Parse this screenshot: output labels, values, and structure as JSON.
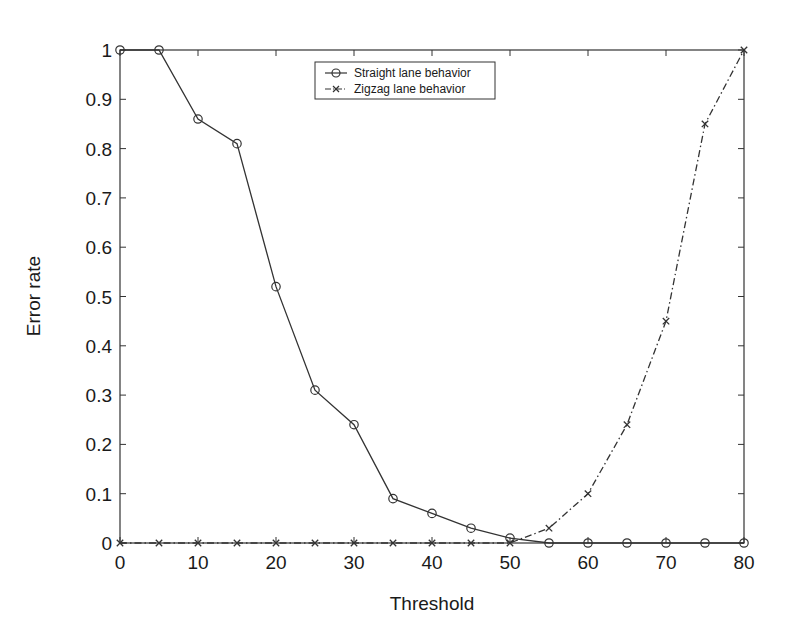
{
  "chart_data": {
    "type": "line",
    "title": "",
    "xlabel": "Threshold",
    "ylabel": "Error rate",
    "xlim": [
      0,
      80
    ],
    "ylim": [
      0,
      1
    ],
    "grid": false,
    "legend_position": "upper center",
    "x_ticks": [
      "0",
      "10",
      "20",
      "30",
      "40",
      "50",
      "60",
      "70",
      "80"
    ],
    "y_ticks": [
      "0",
      "0.1",
      "0.2",
      "0.3",
      "0.4",
      "0.5",
      "0.6",
      "0.7",
      "0.8",
      "0.9",
      "1"
    ],
    "x": [
      0,
      5,
      10,
      15,
      20,
      25,
      30,
      35,
      40,
      45,
      50,
      55,
      60,
      65,
      70,
      75,
      80
    ],
    "series": [
      {
        "name": "Straight lane behavior",
        "marker": "circle",
        "line_style": "solid",
        "values": [
          1.0,
          1.0,
          0.86,
          0.81,
          0.52,
          0.31,
          0.24,
          0.09,
          0.06,
          0.03,
          0.01,
          0,
          0,
          0,
          0,
          0,
          0
        ]
      },
      {
        "name": "Zigzag lane behavior",
        "marker": "x",
        "line_style": "dashdot",
        "values": [
          0,
          0,
          0,
          0,
          0,
          0,
          0,
          0,
          0,
          0,
          0,
          0.03,
          0.1,
          0.24,
          0.45,
          0.85,
          1.0
        ]
      }
    ]
  },
  "colors": {
    "line": "#333333",
    "axes": "#333333",
    "background": "#ffffff"
  }
}
